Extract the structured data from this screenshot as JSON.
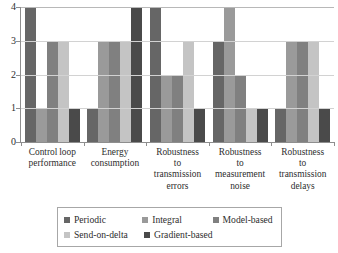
{
  "chart_data": {
    "type": "bar",
    "title": "",
    "xlabel": "",
    "ylabel": "",
    "ylim": [
      0,
      4
    ],
    "yticks": [
      "0",
      "1",
      "2",
      "3",
      "4"
    ],
    "grid": true,
    "legend_position": "bottom",
    "categories": [
      "Control loop performance",
      "Energy consumption",
      "Robustness to transmission errors",
      "Robustness to measurement noise",
      "Robustness to transmission delays"
    ],
    "category_lines": [
      [
        "Control loop",
        "performance"
      ],
      [
        "Energy",
        "consumption"
      ],
      [
        "Robustness",
        "to",
        "transmission",
        "errors"
      ],
      [
        "Robustness",
        "to",
        "measurement",
        "noise"
      ],
      [
        "Robustness",
        "to",
        "transmission",
        "delays"
      ]
    ],
    "series": [
      {
        "name": "Periodic",
        "color": "#666666",
        "values": [
          4,
          1,
          4,
          3,
          1
        ]
      },
      {
        "name": "Integral",
        "color": "#9a9a9a",
        "values": [
          1,
          3,
          2,
          4,
          3
        ]
      },
      {
        "name": "Model-based",
        "color": "#808080",
        "values": [
          3,
          3,
          2,
          2,
          3
        ]
      },
      {
        "name": "Send-on-delta",
        "color": "#c4c4c4",
        "values": [
          3,
          3,
          3,
          1,
          3
        ]
      },
      {
        "name": "Gradient-based",
        "color": "#4a4a4a",
        "values": [
          1,
          4,
          1,
          1,
          1
        ]
      }
    ]
  },
  "legend": {
    "rows": [
      [
        {
          "label": "Periodic",
          "color": "#666666"
        },
        {
          "label": "Integral",
          "color": "#9a9a9a"
        },
        {
          "label": "Model-based",
          "color": "#808080"
        }
      ],
      [
        {
          "label": "Send-on-delta",
          "color": "#c4c4c4"
        },
        {
          "label": "Gradient-based",
          "color": "#4a4a4a"
        }
      ]
    ]
  }
}
